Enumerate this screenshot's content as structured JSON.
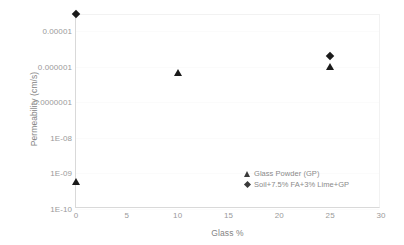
{
  "chart_data": {
    "type": "scatter",
    "title": "",
    "xlabel": "Glass %",
    "ylabel": "Permeability (cm/s)",
    "xlim": [
      0,
      30
    ],
    "ylim": [
      1e-10,
      3e-05
    ],
    "yscale": "log",
    "grid": false,
    "legend_position": "inside-bottom-right",
    "x_ticks": [
      "0",
      "5",
      "10",
      "15",
      "20",
      "25",
      "30"
    ],
    "x_tick_values": [
      0,
      5,
      10,
      15,
      20,
      25,
      30
    ],
    "y_ticks": [
      "0.00001",
      "0.000001",
      "0.0000001",
      "1E-08",
      "1E-09",
      "1E-10"
    ],
    "y_tick_values": [
      1e-05,
      1e-06,
      1e-07,
      1e-08,
      1e-09,
      1e-10
    ],
    "series": [
      {
        "name": "Glass Powder (GP)",
        "marker": "triangle",
        "color": "#1a1a1a",
        "points": [
          {
            "x": 0,
            "y": 6e-10
          },
          {
            "x": 10,
            "y": 7e-07
          },
          {
            "x": 25,
            "y": 1e-06
          }
        ]
      },
      {
        "name": "Soil+7.5% FA+3% Lime+GP",
        "marker": "diamond",
        "color": "#1a1a1a",
        "points": [
          {
            "x": 0,
            "y": 3e-05
          },
          {
            "x": 25,
            "y": 2e-06
          }
        ]
      }
    ]
  },
  "legend": {
    "entries": [
      {
        "label": "Glass Powder (GP)",
        "marker": "triangle"
      },
      {
        "label": "Soil+7.5% FA+3% Lime+GP",
        "marker": "diamond"
      }
    ]
  },
  "axes": {
    "y_title": "Permeability (cm/s)",
    "x_title": "Glass %"
  }
}
